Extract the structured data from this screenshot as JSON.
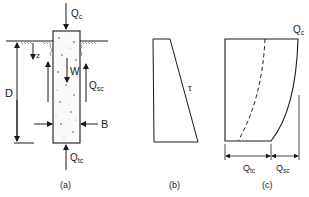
{
  "figure": {
    "panel_a": {
      "caption": "(a)",
      "labels": {
        "top_load": "Q",
        "top_load_sub": "c",
        "depth_var": "z",
        "weight": "W",
        "side_load": "Q",
        "side_load_sub": "sc",
        "depth": "D",
        "width": "B",
        "tip_load": "Q",
        "tip_load_sub": "tc"
      }
    },
    "panel_b": {
      "caption": "(b)",
      "labels": {
        "shear": "τ"
      }
    },
    "panel_c": {
      "caption": "(c)",
      "labels": {
        "top_load": "Q",
        "top_load_sub": "c",
        "tip_load": "Q",
        "tip_load_sub": "tc",
        "side_load": "Q",
        "side_load_sub": "sc"
      }
    },
    "colors": {
      "ink": "#1a1a1a",
      "background": "#ffffff",
      "stipple": "#8a8a8a"
    }
  }
}
